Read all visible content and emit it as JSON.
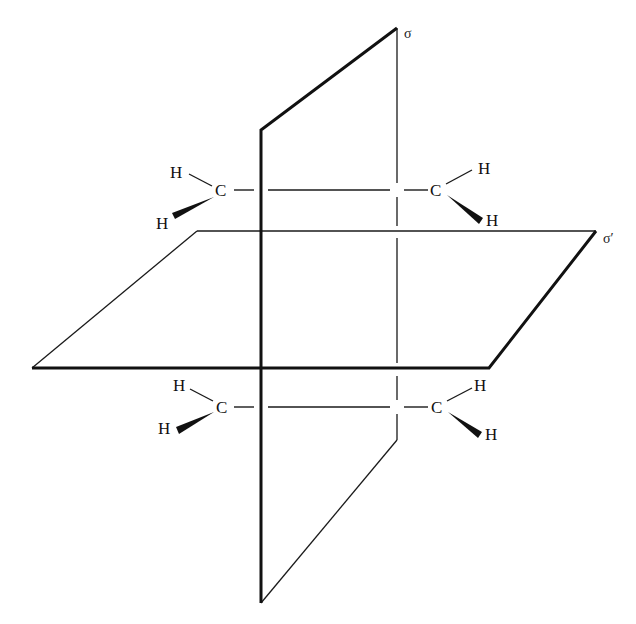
{
  "figure": {
    "type": "symmetry-planes-diagram"
  },
  "planes": [
    {
      "id": "sigma",
      "label": "σ",
      "orientation": "vertical"
    },
    {
      "id": "sigma_prime",
      "label": "σ′",
      "orientation": "horizontal"
    }
  ],
  "molecules": [
    {
      "position": "upper",
      "left_carbon": {
        "symbol": "C",
        "substituents": [
          {
            "symbol": "H",
            "bond": "plain"
          },
          {
            "symbol": "H",
            "bond": "wedge"
          }
        ]
      },
      "right_carbon": {
        "symbol": "C",
        "substituents": [
          {
            "symbol": "H",
            "bond": "plain"
          },
          {
            "symbol": "H",
            "bond": "wedge"
          }
        ]
      }
    },
    {
      "position": "lower",
      "left_carbon": {
        "symbol": "C",
        "substituents": [
          {
            "symbol": "H",
            "bond": "plain"
          },
          {
            "symbol": "H",
            "bond": "wedge"
          }
        ]
      },
      "right_carbon": {
        "symbol": "C",
        "substituents": [
          {
            "symbol": "H",
            "bond": "plain"
          },
          {
            "symbol": "H",
            "bond": "wedge"
          }
        ]
      }
    }
  ]
}
